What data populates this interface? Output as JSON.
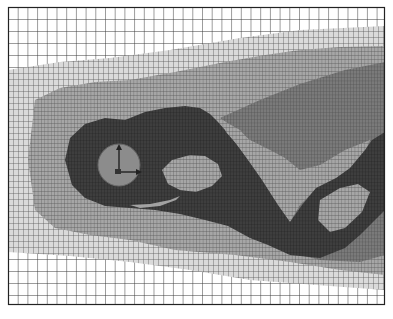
{
  "figure": {
    "type": "adaptive-mesh-refinement",
    "frame": {
      "x": 8,
      "y": 7,
      "width": 377,
      "height": 298
    },
    "colors": {
      "background": "#ffffff",
      "coarse_grid": "#3a3a3a",
      "level1": "#d6d6d6",
      "level2": "#a8a8a8",
      "level3": "#7a7a7a",
      "wake_dark": "#3c3c3c",
      "body": "#8c8c8c",
      "body_outline": "#6a6a6a",
      "axis": "#222222"
    },
    "body": {
      "shape": "circle",
      "cx": 119,
      "cy": 165,
      "r": 21
    },
    "axes": {
      "origin": [
        119,
        172
      ],
      "x_end": [
        141,
        172
      ],
      "y_end": [
        119,
        145
      ]
    }
  }
}
